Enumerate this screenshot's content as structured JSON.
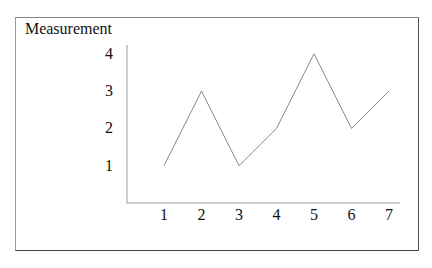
{
  "chart_data": {
    "type": "line",
    "title": "",
    "xlabel": "",
    "ylabel": "Measurement",
    "x": [
      1,
      2,
      3,
      4,
      5,
      6,
      7
    ],
    "series": [
      {
        "name": "Measurement",
        "values": [
          1,
          3,
          1,
          2,
          4,
          2,
          3
        ]
      }
    ],
    "x_ticks": [
      "1",
      "2",
      "3",
      "4",
      "5",
      "6",
      "7"
    ],
    "y_ticks": [
      "1",
      "2",
      "3",
      "4"
    ],
    "ylim": [
      0,
      4
    ],
    "xlim": [
      0,
      7
    ],
    "grid": false,
    "legend": null
  }
}
